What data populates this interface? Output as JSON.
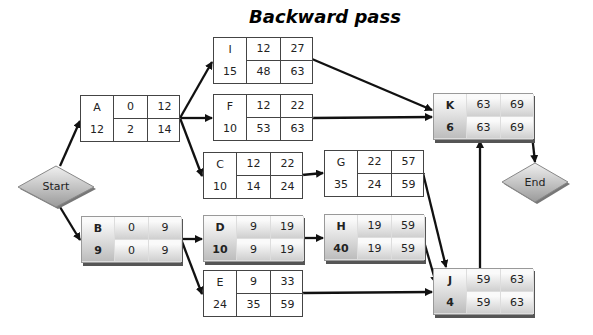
{
  "title": "Backward pass",
  "start_label": "Start",
  "end_label": "End",
  "nodes": {
    "A": {
      "name": "A",
      "es": "0",
      "ef": "12",
      "ls": "2",
      "dur": "12",
      "lf": "14",
      "critical": false
    },
    "B": {
      "name": "B",
      "es": "0",
      "ef": "9",
      "ls": "0",
      "dur": "9",
      "lf": "9",
      "critical": true
    },
    "I": {
      "name": "I",
      "es": "12",
      "ef": "27",
      "ls": "48",
      "dur": "15",
      "lf": "63",
      "critical": false
    },
    "F": {
      "name": "F",
      "es": "12",
      "ef": "22",
      "ls": "53",
      "dur": "10",
      "lf": "63",
      "critical": false
    },
    "C": {
      "name": "C",
      "es": "12",
      "ef": "22",
      "ls": "14",
      "dur": "10",
      "lf": "24",
      "critical": false
    },
    "D": {
      "name": "D",
      "es": "9",
      "ef": "19",
      "ls": "9",
      "dur": "10",
      "lf": "19",
      "critical": true
    },
    "E": {
      "name": "E",
      "es": "9",
      "ef": "33",
      "ls": "35",
      "dur": "24",
      "lf": "59",
      "critical": false
    },
    "G": {
      "name": "G",
      "es": "22",
      "ef": "57",
      "ls": "24",
      "dur": "35",
      "lf": "59",
      "critical": false
    },
    "H": {
      "name": "H",
      "es": "19",
      "ef": "59",
      "ls": "19",
      "dur": "40",
      "lf": "59",
      "critical": true
    },
    "K": {
      "name": "K",
      "es": "63",
      "ef": "69",
      "ls": "63",
      "dur": "6",
      "lf": "69",
      "critical": true
    },
    "J": {
      "name": "J",
      "es": "59",
      "ef": "63",
      "ls": "59",
      "dur": "4",
      "lf": "63",
      "critical": true
    }
  },
  "edges": [
    [
      "Start",
      "A"
    ],
    [
      "Start",
      "B"
    ],
    [
      "A",
      "I"
    ],
    [
      "A",
      "F"
    ],
    [
      "A",
      "C"
    ],
    [
      "B",
      "D"
    ],
    [
      "B",
      "E"
    ],
    [
      "C",
      "G"
    ],
    [
      "D",
      "H"
    ],
    [
      "I",
      "K"
    ],
    [
      "F",
      "K"
    ],
    [
      "G",
      "J"
    ],
    [
      "H",
      "J"
    ],
    [
      "E",
      "J"
    ],
    [
      "J",
      "K"
    ],
    [
      "K",
      "End"
    ]
  ]
}
